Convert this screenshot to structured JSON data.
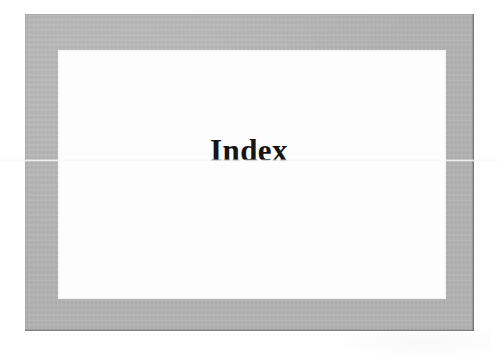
{
  "page": {
    "type": "book-section-divider",
    "background_color": "#ffffff",
    "frame": {
      "border_color": "#b2b2b2",
      "inner_color": "#fdfdfd"
    }
  },
  "content": {
    "title": "Index"
  }
}
